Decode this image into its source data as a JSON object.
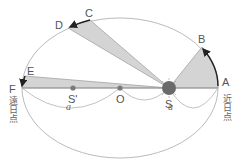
{
  "diagram": {
    "points": {
      "A": {
        "label": "A",
        "x": 218,
        "y": 88
      },
      "B": {
        "label": "B",
        "x": 202,
        "y": 47
      },
      "C": {
        "label": "C",
        "x": 90,
        "y": 20
      },
      "D": {
        "label": "D",
        "x": 68,
        "y": 28
      },
      "E": {
        "label": "E",
        "x": 25,
        "y": 76
      },
      "F": {
        "label": "F",
        "x": 21,
        "y": 88
      },
      "S": {
        "label": "S",
        "x": 169,
        "y": 88
      },
      "O": {
        "label": "O",
        "x": 120,
        "y": 88
      },
      "S_prime": {
        "label": "S'",
        "x": 73,
        "y": 88
      }
    },
    "perihelion_label": "近日点",
    "aphelion_label": "遠日点",
    "semi_major_label_left": "a",
    "semi_major_label_right": "a",
    "colors": {
      "sector_fill": "#d4d4d4",
      "sector_stroke": "#9a9a9a",
      "orbit_stroke": "#a8a8a8",
      "sun_fill": "#6a6a6a",
      "arrow": "#222222",
      "dot": "#7a7a7a"
    },
    "sectors": [
      {
        "name": "sector-A-B",
        "from": "A",
        "to": "B"
      },
      {
        "name": "sector-C-D",
        "from": "C",
        "to": "D"
      },
      {
        "name": "sector-E-F",
        "from": "E",
        "to": "F"
      }
    ]
  }
}
